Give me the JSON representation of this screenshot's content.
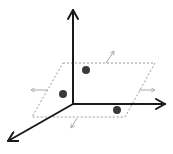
{
  "diagram": {
    "title": "",
    "colors": {
      "axis": "#1a1a1a",
      "plane_edge": "#9a9a9a",
      "small_arrow": "#a8a8a8",
      "point": "#3a3a3a",
      "background": "#ffffff"
    },
    "axes": [
      {
        "name": "vertical-axis",
        "x1": 73,
        "y1": 104,
        "x2": 73,
        "y2": 10
      },
      {
        "name": "right-axis",
        "x1": 73,
        "y1": 104,
        "x2": 165,
        "y2": 104
      },
      {
        "name": "depth-axis",
        "x1": 73,
        "y1": 104,
        "x2": 8,
        "y2": 141
      }
    ],
    "plane": {
      "points": [
        [
          63,
          63
        ],
        [
          155,
          63
        ],
        [
          125,
          117
        ],
        [
          32,
          117
        ]
      ],
      "style": "dashed"
    },
    "points": [
      {
        "name": "point-1",
        "cx": 86,
        "cy": 70,
        "r": 4
      },
      {
        "name": "point-2",
        "cx": 63,
        "cy": 94,
        "r": 4
      },
      {
        "name": "point-3",
        "cx": 117,
        "cy": 110,
        "r": 4
      }
    ],
    "small_arrows": [
      {
        "name": "arrow-up-right",
        "x1": 106,
        "y1": 63,
        "x2": 114,
        "y2": 51
      },
      {
        "name": "arrow-left",
        "x1": 48,
        "y1": 90,
        "x2": 31,
        "y2": 90
      },
      {
        "name": "arrow-right",
        "x1": 139,
        "y1": 90,
        "x2": 155,
        "y2": 90
      },
      {
        "name": "arrow-down-left",
        "x1": 77,
        "y1": 118,
        "x2": 71,
        "y2": 128
      }
    ]
  }
}
